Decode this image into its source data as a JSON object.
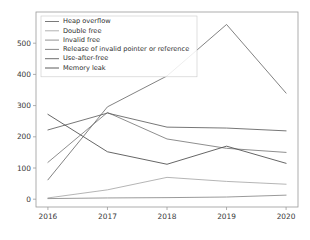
{
  "chart_data": {
    "type": "line",
    "title": "",
    "xlabel": "",
    "ylabel": "",
    "x": [
      2016,
      2017,
      2018,
      2019,
      2020
    ],
    "xticklabels": [
      "2016",
      "2017",
      "2018",
      "2019",
      "2020"
    ],
    "yticklabels": [
      "0",
      "100",
      "200",
      "300",
      "400",
      "500"
    ],
    "ytickvalues": [
      0,
      100,
      200,
      300,
      400,
      500
    ],
    "xlim": [
      2015.8,
      2020.2
    ],
    "ylim": [
      -25,
      600
    ],
    "grid": false,
    "legend_position": "upper left",
    "series": [
      {
        "name": "Heap overflow",
        "values": [
          62,
          296,
          395,
          560,
          340
        ],
        "color": "#6b6b6b"
      },
      {
        "name": "Double free",
        "values": [
          4,
          30,
          70,
          57,
          48
        ],
        "color": "#a8a8a8"
      },
      {
        "name": "Invalid free",
        "values": [
          2,
          4,
          5,
          7,
          13
        ],
        "color": "#888888"
      },
      {
        "name": "Release of invalid pointer or reference",
        "values": [
          118,
          278,
          193,
          163,
          150
        ],
        "color": "#7a7a7a"
      },
      {
        "name": "Use-after-free",
        "values": [
          222,
          276,
          231,
          228,
          219
        ],
        "color": "#5e5e5e"
      },
      {
        "name": "Memory leak",
        "values": [
          272,
          152,
          112,
          170,
          115
        ],
        "color": "#4a4a4a"
      }
    ]
  },
  "axes": {
    "x_tick_labels": [
      "2016",
      "2017",
      "2018",
      "2019",
      "2020"
    ],
    "y_tick_labels": [
      "0",
      "100",
      "200",
      "300",
      "400",
      "500"
    ]
  },
  "legend": {
    "entries": [
      {
        "label": "Heap overflow"
      },
      {
        "label": "Double free"
      },
      {
        "label": "Invalid free"
      },
      {
        "label": "Release of invalid pointer or reference"
      },
      {
        "label": "Use-after-free"
      },
      {
        "label": "Memory leak"
      }
    ]
  }
}
